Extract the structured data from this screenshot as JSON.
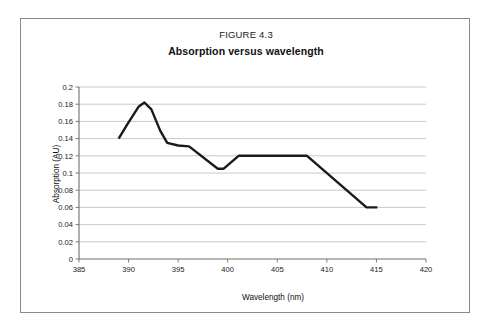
{
  "figure": {
    "caption": "FIGURE 4.3",
    "title": "Absorption versus wavelength"
  },
  "chart_data": {
    "type": "line",
    "title": "Absorption versus wavelength",
    "caption": "FIGURE 4.3",
    "xlabel": "Wavelength (nm)",
    "ylabel": "Absorption (AU)",
    "xlim": [
      385,
      420
    ],
    "ylim": [
      0,
      0.2
    ],
    "xticks": [
      "385",
      "390",
      "395",
      "400",
      "405",
      "410",
      "415",
      "420"
    ],
    "xtick_values": [
      385,
      390,
      395,
      400,
      405,
      410,
      415,
      420
    ],
    "yticks": [
      "0",
      "0.02",
      "0.04",
      "0.06",
      "0.08",
      "0.1",
      "0.12",
      "0.14",
      "0.16",
      "0.18",
      "0.2"
    ],
    "ytick_values": [
      0,
      0.02,
      0.04,
      0.06,
      0.08,
      0.1,
      0.12,
      0.14,
      0.16,
      0.18,
      0.2
    ],
    "grid": "horizontal",
    "legend": "none",
    "series": [
      {
        "name": "Absorption",
        "color": "#1a1a1a",
        "x": [
          389.0,
          389.9,
          391.0,
          391.6,
          392.3,
          393.2,
          393.9,
          395.0,
          396.1,
          399.0,
          399.6,
          401.1,
          408.0,
          414.0,
          415.1
        ],
        "y": [
          0.14,
          0.157,
          0.177,
          0.182,
          0.174,
          0.149,
          0.135,
          0.132,
          0.131,
          0.105,
          0.105,
          0.12,
          0.12,
          0.06,
          0.06
        ]
      }
    ]
  }
}
